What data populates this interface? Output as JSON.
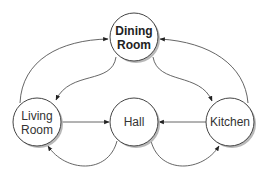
{
  "diagram": {
    "type": "directed-graph",
    "colors": {
      "background": "#ffffff",
      "node_fill": "#ffffff",
      "node_stroke": "#444444",
      "edge_stroke": "#555555",
      "shadow": "#b8b8b8",
      "text": "#333333"
    },
    "nodes": [
      {
        "id": "dining",
        "lines": [
          "Dining",
          "Room"
        ],
        "bold": true,
        "cx": 134,
        "cy": 37,
        "r": 24
      },
      {
        "id": "living",
        "lines": [
          "Living",
          "Room"
        ],
        "bold": false,
        "cx": 37,
        "cy": 122,
        "r": 24
      },
      {
        "id": "hall",
        "lines": [
          "Hall"
        ],
        "bold": false,
        "cx": 134,
        "cy": 122,
        "r": 24
      },
      {
        "id": "kitchen",
        "lines": [
          "Kitchen"
        ],
        "bold": false,
        "cx": 230,
        "cy": 122,
        "r": 24
      }
    ],
    "edges": [
      {
        "from": "living",
        "to": "dining",
        "label": ""
      },
      {
        "from": "kitchen",
        "to": "dining",
        "label": ""
      },
      {
        "from": "dining",
        "to": "living",
        "label": ""
      },
      {
        "from": "dining",
        "to": "kitchen",
        "label": ""
      },
      {
        "from": "living",
        "to": "hall",
        "label": ""
      },
      {
        "from": "kitchen",
        "to": "hall",
        "label": ""
      },
      {
        "from": "hall",
        "to": "living",
        "label": ""
      },
      {
        "from": "hall",
        "to": "kitchen",
        "label": ""
      }
    ]
  }
}
